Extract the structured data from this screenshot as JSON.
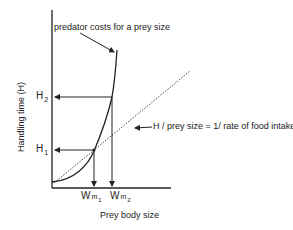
{
  "diagram": {
    "title_annotation": "predator costs for a prey size",
    "line_annotation": "H / prey size = 1/ rate of food intake",
    "y_axis_label": "Handling time (H)",
    "x_axis_label": "Prey body size",
    "y_ticks": [
      {
        "main": "H",
        "sub": "2"
      },
      {
        "main": "H",
        "sub": "1"
      }
    ],
    "x_ticks": [
      {
        "main": "W",
        "sub": "m",
        "subsub": "1"
      },
      {
        "main": "W",
        "sub": "m",
        "subsub": "2"
      }
    ],
    "colors": {
      "line": "#222222",
      "dotted": "#444444"
    }
  }
}
